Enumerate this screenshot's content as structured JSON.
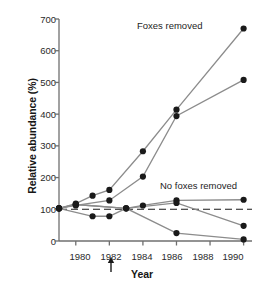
{
  "chart_data": {
    "type": "line",
    "title": "",
    "xlabel": "Year",
    "ylabel": "Relative abundance (%)",
    "xlim": [
      1979,
      1990.5
    ],
    "ylim": [
      0,
      700
    ],
    "yticks": [
      0,
      100,
      200,
      300,
      400,
      500,
      600,
      700
    ],
    "xticks": [
      1980,
      1982,
      1984,
      1986,
      1988,
      1990
    ],
    "grid": false,
    "legend_position": "inline-annotation",
    "reference_line": {
      "y": 100,
      "style": "dashed",
      "label": ""
    },
    "marker": "filled-circle",
    "annotations": [
      {
        "text": "Foxes removed",
        "x": 1985.2,
        "y": 640
      },
      {
        "text": "No foxes removed",
        "x": 1986.3,
        "y": 185
      },
      {
        "text": "arrow-marker",
        "x": 1982,
        "y": -60,
        "symbol": "up-arrow"
      }
    ],
    "series": [
      {
        "name": "Foxes removed - site 1",
        "group": "Foxes removed",
        "x": [
          1979,
          1980,
          1981,
          1982,
          1984,
          1986,
          1990
        ],
        "values": [
          103,
          118,
          143,
          161,
          283,
          414,
          670
        ]
      },
      {
        "name": "Foxes removed - site 2",
        "group": "Foxes removed",
        "x": [
          1979,
          1980,
          1982,
          1984,
          1986,
          1990
        ],
        "values": [
          103,
          112,
          128,
          203,
          394,
          508
        ]
      },
      {
        "name": "No foxes removed - site 1",
        "group": "No foxes removed",
        "x": [
          1979,
          1980,
          1983,
          1984,
          1986,
          1990
        ],
        "values": [
          103,
          115,
          103,
          112,
          128,
          130
        ]
      },
      {
        "name": "No foxes removed - site 2",
        "group": "No foxes removed",
        "x": [
          1979,
          1980,
          1983,
          1986,
          1990
        ],
        "values": [
          103,
          115,
          103,
          120,
          48
        ]
      },
      {
        "name": "No foxes removed - site 3",
        "group": "No foxes removed",
        "x": [
          1979,
          1981,
          1982,
          1983,
          1986,
          1990
        ],
        "values": [
          103,
          78,
          78,
          103,
          25,
          5
        ]
      }
    ]
  },
  "axes": {
    "y_tick_labels": [
      "0",
      "100",
      "200",
      "300",
      "400",
      "500",
      "600",
      "700"
    ],
    "x_tick_labels": [
      "1980",
      "1982",
      "1984",
      "1986",
      "1988",
      "1990"
    ],
    "y_axis_title": "Relative abundance (%)",
    "x_axis_title": "Year"
  },
  "labels": {
    "foxes_removed": "Foxes removed",
    "no_foxes_removed": "No foxes removed"
  },
  "colors": {
    "line": "#8c8c8c",
    "marker": "#1a1a1a",
    "axis": "#6f6f6f",
    "text": "#161616",
    "background": "#ffffff"
  }
}
